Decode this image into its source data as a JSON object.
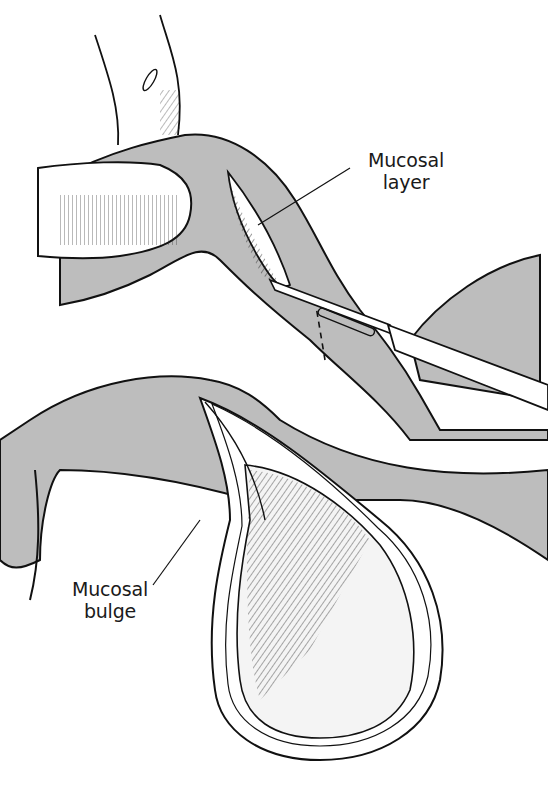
{
  "figure": {
    "colors": {
      "tissue_fill": "#bdbdbd",
      "line": "#111111",
      "background": "#ffffff",
      "lumen": "#f4f4f4"
    }
  },
  "labels": [
    {
      "id": "mucosal-layer",
      "line1": "Mucosal",
      "line2": "layer"
    },
    {
      "id": "mucosal-bulge",
      "line1": "Mucosal",
      "line2": "bulge"
    }
  ]
}
